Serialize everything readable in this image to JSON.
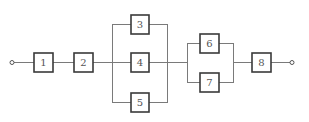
{
  "diagram": {
    "type": "reliability-block-diagram",
    "colors": {
      "wire": "#7a7a7a",
      "box_border": "#3a3a3a",
      "label": "#555555",
      "background": "#ffffff"
    },
    "terminals": {
      "input": "input-terminal",
      "output": "output-terminal"
    },
    "blocks": [
      {
        "id": "1",
        "label": "1"
      },
      {
        "id": "2",
        "label": "2"
      },
      {
        "id": "3",
        "label": "3"
      },
      {
        "id": "4",
        "label": "4"
      },
      {
        "id": "5",
        "label": "5"
      },
      {
        "id": "6",
        "label": "6"
      },
      {
        "id": "7",
        "label": "7"
      },
      {
        "id": "8",
        "label": "8"
      }
    ],
    "structure": "series(1, 2, parallel(3, 4, 5), parallel(6, 7), 8)"
  }
}
